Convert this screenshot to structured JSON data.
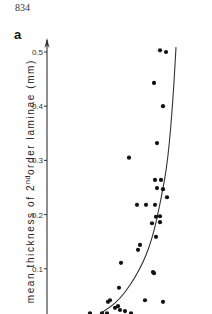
{
  "page": {
    "number": "834",
    "panel_label": "a"
  },
  "axis": {
    "ylabel_prefix": "mean thickness of 2",
    "ylabel_sup": "nd",
    "ylabel_suffix": "order laminae (mm)"
  },
  "chart_data": {
    "type": "scatter",
    "title": "",
    "panel": "a",
    "xlabel": "",
    "ylabel": "mean thickness of 2nd order laminae (mm)",
    "yticks": [
      0.1,
      0.2,
      0.3,
      0.4,
      0.5
    ],
    "ytick_labels": [
      "0.1",
      "0.2",
      "0.3",
      "0.4",
      "0.5"
    ],
    "ylim": [
      0.0,
      0.52
    ],
    "x_axis_visible": false,
    "grid": false,
    "legend": null,
    "note": "x-axis not visible (image cropped); x values given in relative pixel units from the y-axis",
    "series": [
      {
        "name": "observations",
        "marker": "filled-circle",
        "points": [
          {
            "x": 113,
            "y": 0.503
          },
          {
            "x": 119,
            "y": 0.5
          },
          {
            "x": 107,
            "y": 0.443
          },
          {
            "x": 116,
            "y": 0.4
          },
          {
            "x": 110,
            "y": 0.332
          },
          {
            "x": 82,
            "y": 0.305
          },
          {
            "x": 108,
            "y": 0.264
          },
          {
            "x": 114,
            "y": 0.264
          },
          {
            "x": 110,
            "y": 0.249
          },
          {
            "x": 116,
            "y": 0.247
          },
          {
            "x": 120,
            "y": 0.232
          },
          {
            "x": 90,
            "y": 0.218
          },
          {
            "x": 99,
            "y": 0.218
          },
          {
            "x": 108,
            "y": 0.218
          },
          {
            "x": 109,
            "y": 0.196
          },
          {
            "x": 113,
            "y": 0.197
          },
          {
            "x": 105,
            "y": 0.184
          },
          {
            "x": 113,
            "y": 0.186
          },
          {
            "x": 109,
            "y": 0.159
          },
          {
            "x": 93,
            "y": 0.144
          },
          {
            "x": 91,
            "y": 0.135
          },
          {
            "x": 74,
            "y": 0.111
          },
          {
            "x": 106,
            "y": 0.094
          },
          {
            "x": 107,
            "y": 0.092
          },
          {
            "x": 72,
            "y": 0.065
          },
          {
            "x": 63,
            "y": 0.042
          },
          {
            "x": 61,
            "y": 0.039
          },
          {
            "x": 98,
            "y": 0.042
          },
          {
            "x": 116,
            "y": 0.039
          },
          {
            "x": 68,
            "y": 0.028
          },
          {
            "x": 71,
            "y": 0.031
          },
          {
            "x": 73,
            "y": 0.024
          },
          {
            "x": 78,
            "y": 0.022
          },
          {
            "x": 84,
            "y": 0.018
          },
          {
            "x": 43,
            "y": 0.018
          },
          {
            "x": 55,
            "y": 0.018
          },
          {
            "x": 60,
            "y": 0.018
          }
        ]
      },
      {
        "name": "fitted curve",
        "type": "line",
        "points": [
          {
            "x": 129,
            "y": 0.509
          },
          {
            "x": 126,
            "y": 0.412
          },
          {
            "x": 121,
            "y": 0.301
          },
          {
            "x": 114,
            "y": 0.227
          },
          {
            "x": 105,
            "y": 0.153
          },
          {
            "x": 93,
            "y": 0.098
          },
          {
            "x": 73,
            "y": 0.042
          },
          {
            "x": 53,
            "y": 0.017
          }
        ]
      }
    ]
  }
}
